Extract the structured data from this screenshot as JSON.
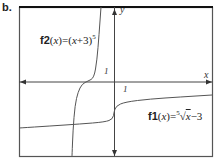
{
  "panel_label": "b.",
  "chart_data": {
    "type": "line",
    "title": "",
    "xlabel": "x",
    "ylabel": "y",
    "grid": false,
    "tick_labels": {
      "x_unit": "1",
      "y_unit": "1"
    },
    "series": [
      {
        "name": "f2(x)=(x+3)^5",
        "label_parts": {
          "fname": "f2",
          "arg": "x",
          "expr_open": "(",
          "var": "x",
          "expr_rest": "+3)",
          "exp": "5"
        },
        "points_px": [
          [
            72,
            156
          ],
          [
            73,
            130
          ],
          [
            75,
            105
          ],
          [
            78,
            92
          ],
          [
            82,
            84
          ],
          [
            88,
            81
          ],
          [
            94,
            78
          ],
          [
            97,
            60
          ],
          [
            99,
            35
          ],
          [
            101,
            7
          ]
        ]
      },
      {
        "name": "f1(x)=5th-root(x)-3",
        "label_parts": {
          "fname": "f1",
          "arg": "x",
          "index": "5",
          "var": "x",
          "expr_rest": "−3"
        },
        "points_px": [
          [
            19,
            128
          ],
          [
            50,
            126
          ],
          [
            80,
            124
          ],
          [
            105,
            122
          ],
          [
            113,
            119
          ],
          [
            114,
            112
          ],
          [
            116,
            106
          ],
          [
            125,
            102
          ],
          [
            150,
            99
          ],
          [
            180,
            97
          ],
          [
            212,
            95
          ]
        ]
      }
    ],
    "colors": {
      "frame": "#1a1a1a",
      "axes": "#333333",
      "curves": "#444444"
    }
  }
}
